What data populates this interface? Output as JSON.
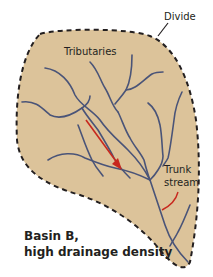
{
  "diagram": {
    "title_line1": "Basin B,",
    "title_line2": "high drainage density",
    "labels": {
      "divide": "Divide",
      "tributaries": "Tributaries",
      "trunk_line1": "Trunk",
      "trunk_line2": "stream"
    },
    "colors": {
      "basin_fill": "#dcc39a",
      "divide_line": "#231f20",
      "stream": "#4a5478",
      "arrow": "#c8281e",
      "text": "#231f20"
    }
  }
}
